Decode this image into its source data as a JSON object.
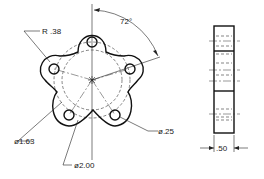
{
  "drawing": {
    "type": "engineering-drawing",
    "views": [
      "front-view",
      "side-view"
    ],
    "dimensions": {
      "angle": "72°",
      "fillet_radius": "R .38",
      "bolt_circle": "ø1.63",
      "outer_circle": "ø2.00",
      "hole_diameter": "ø.25",
      "thickness": ".50"
    },
    "hole_count": 5
  }
}
